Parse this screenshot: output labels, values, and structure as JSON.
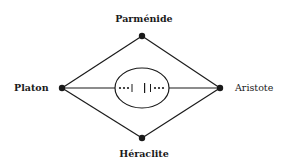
{
  "diagram": {
    "nodes": {
      "top": {
        "label": "Parménide",
        "x": 142,
        "y": 36
      },
      "left": {
        "label": "Platon",
        "x": 62,
        "y": 88
      },
      "right": {
        "label": "Aristote",
        "x": 220,
        "y": 88
      },
      "bottom": {
        "label": "Héraclite",
        "x": 142,
        "y": 138
      }
    },
    "center": {
      "shape": "ellipse",
      "symbol": "•••| |•••",
      "cx": 142,
      "cy": 88,
      "rx": 27,
      "ry": 20
    },
    "edges": [
      {
        "from": "left",
        "to": "top"
      },
      {
        "from": "top",
        "to": "right"
      },
      {
        "from": "left",
        "to": "bottom"
      },
      {
        "from": "bottom",
        "to": "right"
      },
      {
        "from": "left",
        "to": "center"
      },
      {
        "from": "center",
        "to": "right"
      }
    ],
    "colors": {
      "stroke": "#1a1a1a",
      "background": "#ffffff"
    }
  }
}
